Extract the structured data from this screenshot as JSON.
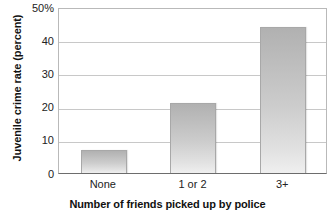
{
  "chart_data": {
    "type": "bar",
    "title": "",
    "subtitle": "",
    "xlabel": "Number of friends picked up by police",
    "ylabel": "Juvenile crime rate (percent)",
    "categories": [
      "None",
      "1 or 2",
      "3+"
    ],
    "values": [
      7,
      21,
      44
    ],
    "series": [
      {
        "name": "Juvenile crime rate",
        "values": [
          7,
          21,
          44
        ]
      }
    ],
    "ylim": [
      0,
      50
    ],
    "ytick_labels": [
      "50%",
      "40",
      "30",
      "20",
      "10",
      "0"
    ],
    "ytick_values": [
      50,
      40,
      30,
      20,
      10,
      0
    ],
    "ytick_interval": 10,
    "grid": true,
    "grid_axis": "y",
    "legend": false,
    "legend_position": "none",
    "annotations": [],
    "bar_fill_top_color": "#b1b1b1",
    "bar_fill_bottom_color": "#efefef",
    "bar_border_color": "#a8a8a8",
    "gridline_color": "#c8c8c8",
    "axis_color": "#6d6d6d",
    "plot_background_color": "#ffffff"
  }
}
